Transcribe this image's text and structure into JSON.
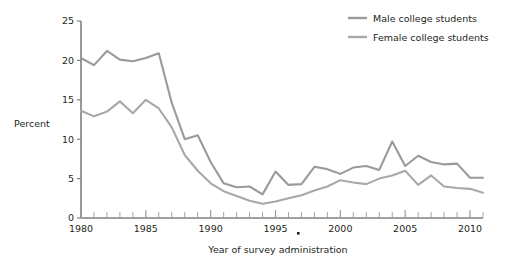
{
  "chart_data": {
    "type": "line",
    "title": "",
    "xlabel": "Year of survey administration",
    "ylabel": "Percent",
    "xlim": [
      1980,
      2011
    ],
    "ylim": [
      0,
      25
    ],
    "yticks": [
      0,
      5,
      10,
      15,
      20,
      25
    ],
    "ytick_labels": [
      "0",
      "5",
      "10",
      "15",
      "20",
      "25"
    ],
    "xticks": [
      1980,
      1985,
      1990,
      1995,
      2000,
      2005,
      2010
    ],
    "xtick_labels": [
      "1980",
      "1985",
      "1990",
      "1995",
      "2000",
      "2005",
      "2010"
    ],
    "minor_xtick_interval": 1,
    "grid": false,
    "legend_position": "top-right",
    "x": [
      1980,
      1981,
      1982,
      1983,
      1984,
      1985,
      1986,
      1987,
      1988,
      1989,
      1990,
      1991,
      1992,
      1993,
      1994,
      1995,
      1996,
      1997,
      1998,
      1999,
      2000,
      2001,
      2002,
      2003,
      2004,
      2005,
      2006,
      2007,
      2008,
      2009,
      2010,
      2011
    ],
    "series": [
      {
        "name": "Male college students",
        "color": "#9a9a9a",
        "values": [
          20.3,
          19.4,
          21.2,
          20.1,
          19.9,
          20.3,
          20.9,
          14.6,
          10.0,
          10.5,
          7.1,
          4.4,
          3.9,
          4.0,
          3.0,
          5.9,
          4.2,
          4.3,
          6.5,
          6.2,
          5.6,
          6.4,
          6.6,
          6.1,
          9.7,
          6.6,
          7.9,
          7.1,
          6.8,
          6.9,
          5.1,
          5.1
        ]
      },
      {
        "name": "Female college students",
        "color": "#a8a8a8",
        "values": [
          13.6,
          12.9,
          13.5,
          14.8,
          13.3,
          15.0,
          13.9,
          11.5,
          8.0,
          6.0,
          4.4,
          3.4,
          2.8,
          2.2,
          1.8,
          2.1,
          2.5,
          2.9,
          3.5,
          4.0,
          4.8,
          4.5,
          4.3,
          5.0,
          5.4,
          6.0,
          4.2,
          5.4,
          4.0,
          3.8,
          3.7,
          3.2
        ]
      }
    ],
    "annotations": [
      {
        "name": "stray-dot",
        "x_px": 297,
        "y_px": 232
      }
    ]
  }
}
